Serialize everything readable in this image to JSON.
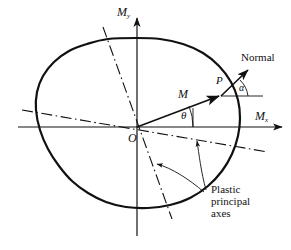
{
  "figure": {
    "type": "technical-diagram",
    "background": "#ffffff",
    "stroke_color": "#111111",
    "width": 291,
    "height": 250
  },
  "axes": {
    "origin_label": "O",
    "origin": [
      137,
      127
    ],
    "x_axis": {
      "label_main": "M",
      "label_sub": "x",
      "from": [
        18,
        127
      ],
      "to": [
        285,
        127
      ],
      "arrow": true
    },
    "y_axis": {
      "label_main": "M",
      "label_sub": "y",
      "from": [
        137,
        236
      ],
      "to": [
        137,
        14
      ],
      "arrow": true
    }
  },
  "yield_surface": {
    "name": "yield-locus-curve",
    "closed": true,
    "stroke_width": 2.2,
    "points": [
      [
        137,
        38
      ],
      [
        160,
        39
      ],
      [
        183,
        44
      ],
      [
        203,
        53
      ],
      [
        219,
        66
      ],
      [
        231,
        82
      ],
      [
        238,
        100
      ],
      [
        240,
        118
      ],
      [
        238,
        136
      ],
      [
        232,
        154
      ],
      [
        222,
        171
      ],
      [
        208,
        186
      ],
      [
        190,
        198
      ],
      [
        170,
        205
      ],
      [
        148,
        208
      ],
      [
        126,
        207
      ],
      [
        106,
        202
      ],
      [
        88,
        193
      ],
      [
        72,
        181
      ],
      [
        59,
        166
      ],
      [
        48,
        149
      ],
      [
        40,
        130
      ],
      [
        36,
        110
      ],
      [
        37,
        92
      ],
      [
        43,
        76
      ],
      [
        54,
        62
      ],
      [
        69,
        51
      ],
      [
        87,
        44
      ],
      [
        108,
        39
      ],
      [
        137,
        38
      ]
    ]
  },
  "principal_axes": {
    "label_lines": [
      "Plastic",
      "principal",
      "axes"
    ],
    "style": "dash-dot",
    "axis_steep": {
      "name": "plastic-principal-axis-steep",
      "from": [
        103,
        27
      ],
      "to": [
        172,
        219
      ]
    },
    "axis_shallow": {
      "name": "plastic-principal-axis-shallow",
      "from": [
        22,
        110
      ],
      "to": [
        268,
        152
      ]
    },
    "leader_1": {
      "from": [
        205,
        191
      ],
      "to": [
        196,
        139
      ]
    },
    "leader_2": {
      "from": [
        203,
        192
      ],
      "to": [
        154,
        163
      ]
    }
  },
  "moment_vector": {
    "label": "M",
    "from": [
      137,
      127
    ],
    "to": [
      222,
      95
    ],
    "angle_label": "θ",
    "angle_name": "theta"
  },
  "normal_vector": {
    "label": "Normal",
    "point_label": "P",
    "point": [
      222,
      95
    ],
    "to": [
      250,
      68
    ],
    "reference_line_to": [
      263,
      95
    ],
    "angle_label": "α",
    "angle_name": "alpha"
  }
}
